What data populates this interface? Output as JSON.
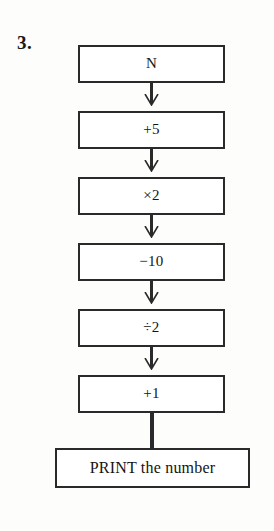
{
  "page": {
    "problem_number": "3.",
    "background_color": "#fdfdfc",
    "line_color": "#2a2a2a",
    "text_color": "#141414"
  },
  "flowchart": {
    "type": "vertical-sequence",
    "steps": [
      {
        "id": "start",
        "label": "N",
        "shape": "rectangle",
        "width": "narrow"
      },
      {
        "id": "add5",
        "label": "+5",
        "shape": "rectangle",
        "width": "narrow"
      },
      {
        "id": "times2",
        "label": "×2",
        "shape": "rectangle",
        "width": "narrow"
      },
      {
        "id": "minus10",
        "label": "−10",
        "shape": "rectangle",
        "width": "narrow"
      },
      {
        "id": "divide2",
        "label": "÷2",
        "shape": "rectangle",
        "width": "narrow"
      },
      {
        "id": "add1",
        "label": "+1",
        "shape": "rectangle",
        "width": "narrow"
      },
      {
        "id": "output",
        "label": "PRINT the number",
        "shape": "rectangle",
        "width": "wide"
      }
    ],
    "connectors": [
      {
        "from": "start",
        "to": "add5",
        "arrowhead": true
      },
      {
        "from": "add5",
        "to": "times2",
        "arrowhead": true
      },
      {
        "from": "times2",
        "to": "minus10",
        "arrowhead": true
      },
      {
        "from": "minus10",
        "to": "divide2",
        "arrowhead": true
      },
      {
        "from": "divide2",
        "to": "add1",
        "arrowhead": true
      },
      {
        "from": "add1",
        "to": "output",
        "arrowhead": false
      }
    ]
  }
}
